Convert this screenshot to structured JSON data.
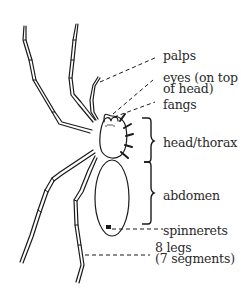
{
  "diagram": {
    "labels": {
      "palps": "palps",
      "eyes_line1": "eyes (on top",
      "eyes_line2": "of head)",
      "fangs": "fangs",
      "head_thorax": "head/thorax",
      "abdomen": "abdomen",
      "spinnerets": "spinnerets",
      "legs_line1": "8 legs",
      "legs_line2": "(7 segments)"
    },
    "colors": {
      "ink": "#1a1a1a",
      "text": "#2a2a2a",
      "background": "#ffffff"
    }
  }
}
